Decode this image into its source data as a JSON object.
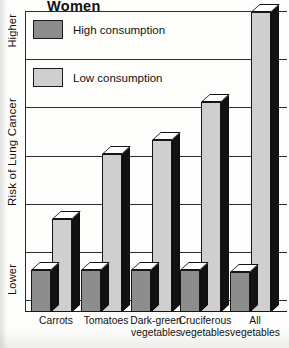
{
  "title": "Women",
  "axis": {
    "y_title": "Risk of Lung Cancer",
    "y_top_label": "Higher",
    "y_bottom_label": "Lower"
  },
  "legend": {
    "items": [
      {
        "label": "High consumption",
        "swatch": "high-consumption-swatch",
        "color": "#8d8d8d"
      },
      {
        "label": "Low consumption",
        "swatch": "low-consumption-swatch",
        "color": "#cfcfcf"
      }
    ]
  },
  "chart_data": {
    "type": "bar",
    "title": "Women",
    "xlabel": "",
    "ylabel": "Risk of Lung Cancer",
    "ylim": [
      0,
      7
    ],
    "ytick_labels": [
      "Lower",
      "Higher"
    ],
    "grid": true,
    "gridlines": 7,
    "legend_position": "inside-upper-left",
    "style": "3d-bars",
    "categories": [
      "Carrots",
      "Tomatoes",
      "Dark-green\nvegetables",
      "Cruciferous\nvegetables",
      "All\nvegetables"
    ],
    "series": [
      {
        "name": "High consumption",
        "color": "#8d8d8d",
        "values": [
          1.0,
          1.0,
          1.0,
          1.0,
          0.95
        ]
      },
      {
        "name": "Low consumption",
        "color": "#cfcfcf",
        "values": [
          2.15,
          3.65,
          3.95,
          4.85,
          6.95
        ]
      }
    ]
  },
  "bars": [
    {
      "group": "Carrots",
      "label": "Carrots",
      "x": 6,
      "high_h": 42,
      "low_h": 93
    },
    {
      "group": "Tomatoes",
      "label": "Tomatoes",
      "x": 56,
      "high_h": 42,
      "low_h": 158
    },
    {
      "group": "Dark-green vegetables",
      "label": "Dark-green\nvegetables",
      "x": 106,
      "high_h": 42,
      "low_h": 172
    },
    {
      "group": "Cruciferous vegetables",
      "label": "Cruciferous\nvegetables",
      "x": 155,
      "high_h": 42,
      "low_h": 210
    },
    {
      "group": "All vegetables",
      "label": "All\nvegetables",
      "x": 205,
      "high_h": 40,
      "low_h": 300
    }
  ]
}
